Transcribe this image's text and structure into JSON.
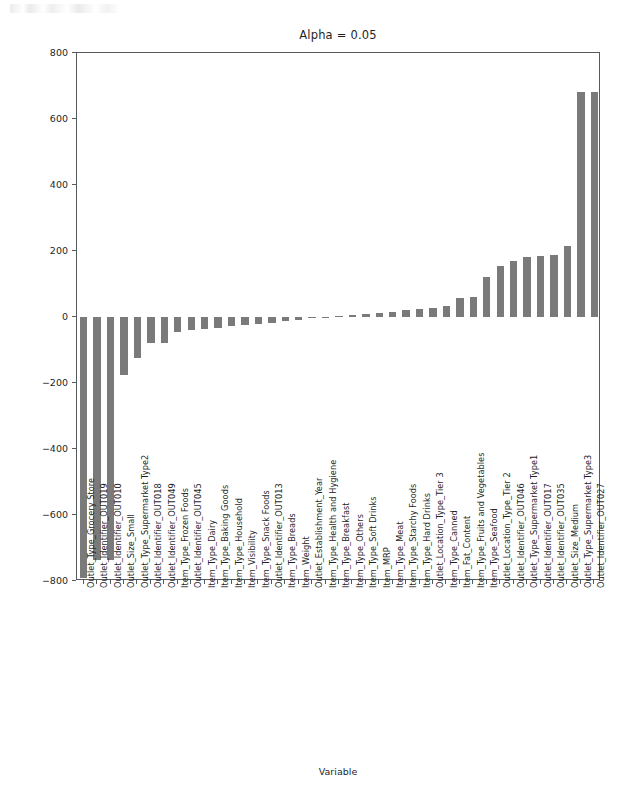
{
  "figure": {
    "width": 641,
    "height": 804,
    "background": "#ffffff",
    "bar_color": "#7a7a7a",
    "axis_color": "#555a5f",
    "text_color": "#1f1f1f"
  },
  "chart_data": {
    "type": "bar",
    "title": "Alpha = 0.05",
    "xlabel": "Variable",
    "ylabel": "Coefficients",
    "ylim": [
      -800,
      800
    ],
    "yticks": [
      800,
      600,
      400,
      200,
      0,
      -200,
      -400,
      -600,
      -800
    ],
    "grid": false,
    "legend": null,
    "orientation": "vertical",
    "categories": [
      "Outlet_Type_Grocery Store",
      "Outlet_Identifier_OUT019",
      "Outlet_Identifier_OUT010",
      "Outlet_Size_Small",
      "Outlet_Type_Supermarket Type2",
      "Outlet_Identifier_OUT018",
      "Outlet_Identifier_OUT049",
      "Item_Type_Frozen Foods",
      "Outlet_Identifier_OUT045",
      "Item_Type_Dairy",
      "Item_Type_Baking Goods",
      "Item_Type_Household",
      "Item_Visibility",
      "Item_Type_Snack Foods",
      "Outlet_Identifier_OUT013",
      "Item_Type_Breads",
      "Item_Weight",
      "Outlet_Establishment_Year",
      "Item_Type_Health and Hygiene",
      "Item_Type_Breakfast",
      "Item_Type_Others",
      "Item_Type_Soft Drinks",
      "Item_MRP",
      "Item_Type_Meat",
      "Item_Type_Starchy Foods",
      "Item_Type_Hard Drinks",
      "Outlet_Location_Type_Tier 3",
      "Item_Type_Canned",
      "Item_Fat_Content",
      "Item_Type_Fruits and Vegetables",
      "Item_Type_Seafood",
      "Outlet_Location_Type_Tier 2",
      "Outlet_Identifier_OUT046",
      "Outlet_Type_Supermarket Type1",
      "Outlet_Identifier_OUT017",
      "Outlet_Identifier_OUT035",
      "Outlet_Size_Medium",
      "Outlet_Type_Supermarket Type3",
      "Outlet_Identifier_OUT027"
    ],
    "values": [
      -790,
      -735,
      -735,
      -175,
      -125,
      -78,
      -78,
      -45,
      -40,
      -36,
      -32,
      -28,
      -25,
      -22,
      -18,
      -12,
      -8,
      -3,
      -2,
      3,
      6,
      9,
      12,
      16,
      20,
      24,
      28,
      34,
      58,
      62,
      120,
      155,
      170,
      182,
      186,
      188,
      215,
      682,
      682
    ]
  }
}
